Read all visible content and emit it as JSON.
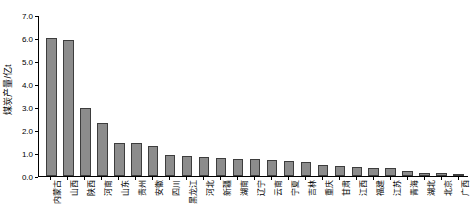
{
  "chart_data": {
    "type": "bar",
    "title": "",
    "xlabel": "",
    "ylabel": "煤炭产量/亿t",
    "ylim": [
      0.0,
      7.0
    ],
    "ytick_labels": [
      "0.0",
      "1.0",
      "2.0",
      "3.0",
      "4.0",
      "5.0",
      "6.0",
      "7.0"
    ],
    "ytick_values": [
      0.0,
      1.0,
      2.0,
      3.0,
      4.0,
      5.0,
      6.0,
      7.0
    ],
    "grid": false,
    "legend": null,
    "bar_color": "#8c8c8c",
    "bar_edge_color": "#3d3d3d",
    "axis_color": "#000000",
    "categories": [
      "内蒙古",
      "山西",
      "陕西",
      "河南",
      "山东",
      "贵州",
      "安徽",
      "四川",
      "黑龙江",
      "河北",
      "新疆",
      "湖南",
      "辽宁",
      "云南",
      "宁夏",
      "吉林",
      "重庆",
      "甘肃",
      "江西",
      "福建",
      "江苏",
      "青海",
      "湖北",
      "北京",
      "广西"
    ],
    "values": [
      6.0,
      5.9,
      2.95,
      2.3,
      1.45,
      1.43,
      1.3,
      0.93,
      0.85,
      0.82,
      0.8,
      0.75,
      0.72,
      0.7,
      0.65,
      0.6,
      0.46,
      0.43,
      0.38,
      0.36,
      0.34,
      0.2,
      0.15,
      0.12,
      0.08
    ]
  }
}
